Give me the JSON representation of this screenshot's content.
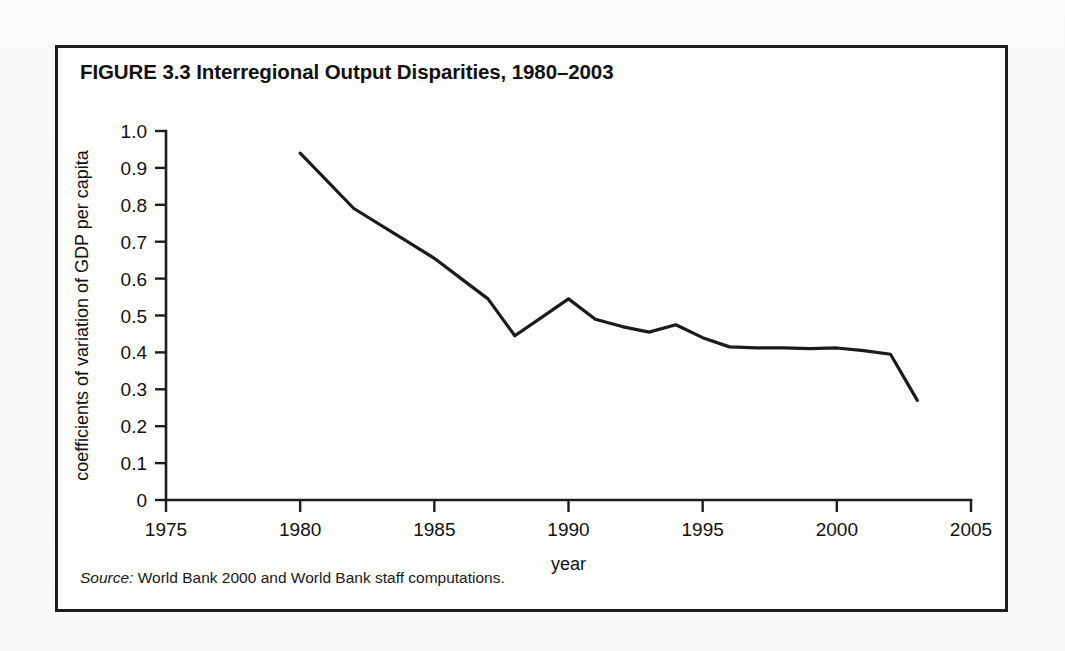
{
  "figure": {
    "title": "FIGURE 3.3  Interregional Output Disparities, 1980–2003",
    "source_label": "Source:",
    "source_text": " World Bank 2000 and World Bank staff computations."
  },
  "chart_data": {
    "type": "line",
    "title": "FIGURE 3.3  Interregional Output Disparities, 1980–2003",
    "xlabel": "year",
    "ylabel": "coefficients of variation of GDP per capita",
    "xlim": [
      1975,
      2005
    ],
    "ylim": [
      0,
      1.0
    ],
    "xticks": [
      1975,
      1980,
      1985,
      1990,
      1995,
      2000,
      2005
    ],
    "xticklabels": [
      "1975",
      "1980",
      "1985",
      "1990",
      "1995",
      "2000",
      "2005"
    ],
    "yticks": [
      0,
      0.1,
      0.2,
      0.3,
      0.4,
      0.5,
      0.6,
      0.7,
      0.8,
      0.9,
      1.0
    ],
    "yticklabels": [
      "0",
      "0.1",
      "0.2",
      "0.3",
      "0.4",
      "0.5",
      "0.6",
      "0.7",
      "0.8",
      "0.9",
      "1.0"
    ],
    "grid": false,
    "legend": false,
    "line_color": "#1b1b1b",
    "series": [
      {
        "name": "coefficient of variation of GDP per capita",
        "x": [
          1980,
          1982,
          1984,
          1985,
          1986,
          1987,
          1988,
          1989,
          1990,
          1991,
          1992,
          1993,
          1994,
          1995,
          1996,
          1997,
          1998,
          1999,
          2000,
          2001,
          2002,
          2003
        ],
        "values": [
          0.94,
          0.79,
          0.7,
          0.655,
          0.6,
          0.545,
          0.445,
          0.495,
          0.545,
          0.49,
          0.47,
          0.455,
          0.475,
          0.44,
          0.415,
          0.412,
          0.412,
          0.41,
          0.412,
          0.405,
          0.395,
          0.27
        ]
      }
    ]
  }
}
